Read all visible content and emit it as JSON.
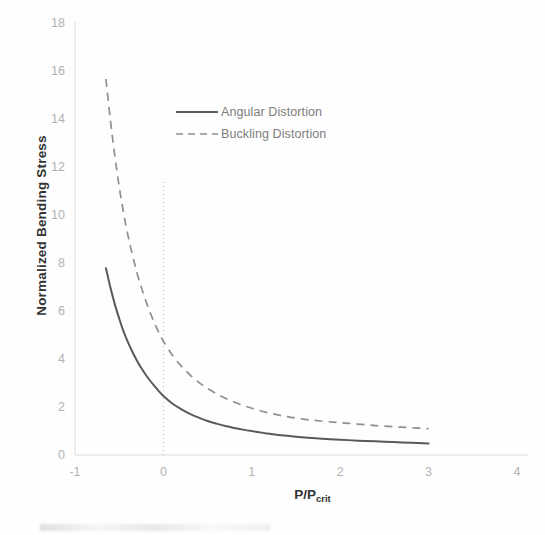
{
  "chart_data": {
    "type": "line",
    "title": "",
    "xlabel": "P/P",
    "xlabel_sub": "crit",
    "ylabel": "Normalized Bending Stress",
    "xlim": [
      -1,
      4
    ],
    "ylim": [
      0,
      18
    ],
    "xticks": [
      "-1",
      "0",
      "1",
      "2",
      "3",
      "4"
    ],
    "yticks": [
      "0",
      "2",
      "4",
      "6",
      "8",
      "10",
      "12",
      "14",
      "16",
      "18"
    ],
    "grid": false,
    "legend_position": "inside-top-center",
    "annotations": [
      {
        "name": "critical-load-reference-line",
        "type": "vertical-dotted-line",
        "x": 0,
        "y_from": 0,
        "y_to": 11.4,
        "color": "#bdbdbd"
      }
    ],
    "series": [
      {
        "name": "Angular Distortion",
        "style": "solid",
        "color": "#5a5a5a",
        "x": [
          -0.65,
          -0.6,
          -0.55,
          -0.5,
          -0.45,
          -0.4,
          -0.35,
          -0.3,
          -0.25,
          -0.2,
          -0.15,
          -0.1,
          -0.05,
          0.0,
          0.1,
          0.2,
          0.3,
          0.4,
          0.5,
          0.6,
          0.7,
          0.8,
          0.9,
          1.0,
          1.2,
          1.4,
          1.6,
          1.8,
          2.0,
          2.2,
          2.4,
          2.6,
          2.8,
          3.0
        ],
        "y": [
          7.8,
          7.0,
          6.3,
          5.7,
          5.15,
          4.7,
          4.3,
          3.95,
          3.63,
          3.35,
          3.1,
          2.88,
          2.66,
          2.46,
          2.15,
          1.92,
          1.72,
          1.56,
          1.42,
          1.31,
          1.21,
          1.13,
          1.06,
          1.0,
          0.89,
          0.8,
          0.73,
          0.68,
          0.64,
          0.6,
          0.57,
          0.54,
          0.51,
          0.48
        ]
      },
      {
        "name": "Buckling Distortion",
        "style": "dashed",
        "color": "#8f8f8f",
        "x": [
          -0.65,
          -0.6,
          -0.55,
          -0.5,
          -0.45,
          -0.4,
          -0.35,
          -0.3,
          -0.25,
          -0.2,
          -0.15,
          -0.1,
          -0.05,
          0.0,
          0.1,
          0.2,
          0.3,
          0.4,
          0.5,
          0.6,
          0.7,
          0.8,
          0.9,
          1.0,
          1.2,
          1.4,
          1.6,
          1.8,
          2.0,
          2.2,
          2.4,
          2.6,
          2.8,
          3.0
        ],
        "y": [
          15.7,
          14.0,
          12.5,
          11.2,
          10.1,
          9.15,
          8.35,
          7.62,
          7.0,
          6.45,
          5.95,
          5.5,
          5.1,
          4.75,
          4.18,
          3.72,
          3.35,
          3.03,
          2.78,
          2.56,
          2.37,
          2.21,
          2.07,
          1.95,
          1.75,
          1.6,
          1.49,
          1.41,
          1.35,
          1.29,
          1.23,
          1.18,
          1.14,
          1.1
        ]
      }
    ]
  },
  "legend": {
    "items": [
      {
        "label": "Angular Distortion",
        "style": "solid"
      },
      {
        "label": "Buckling Distortion",
        "style": "dashed"
      }
    ]
  },
  "colors": {
    "axis": "#dcdcdc",
    "tick_text": "#b2b2b2",
    "axis_title": "#333333",
    "legend_text": "#7d7d7d",
    "solid_series": "#5a5a5a",
    "dashed_series": "#8f8f8f",
    "reference_line": "#bdbdbd",
    "background": "#fefefe"
  }
}
